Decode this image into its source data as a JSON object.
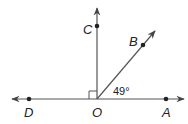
{
  "diagram": {
    "type": "geometry-angles",
    "points": [
      {
        "id": "C",
        "label": "C"
      },
      {
        "id": "B",
        "label": "B"
      },
      {
        "id": "D",
        "label": "D"
      },
      {
        "id": "O",
        "label": "O"
      },
      {
        "id": "A",
        "label": "A"
      }
    ],
    "angle_label": "49°",
    "right_angle_marker": "COD",
    "colors": {
      "line": "#444444",
      "text": "#222222"
    }
  }
}
